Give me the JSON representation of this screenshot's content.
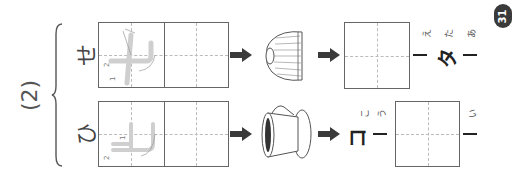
{
  "page": {
    "orientation": "rotated 90deg counter-clockwise",
    "page_number": "31"
  },
  "question": {
    "number": "(2)"
  },
  "rows": [
    {
      "kana": "せ",
      "trace_hint": "世",
      "stroke_labels": [
        "1",
        "2"
      ],
      "picture": "sweater",
      "answer_sequence": [
        {
          "type": "box",
          "furigana": ""
        },
        {
          "type": "mark",
          "text": "ー",
          "furigana": "え"
        },
        {
          "type": "kana",
          "text": "タ",
          "furigana": "た"
        },
        {
          "type": "mark",
          "text": "ー",
          "furigana": "あ"
        }
      ]
    },
    {
      "kana": "ひ",
      "trace_hint": "比",
      "stroke_labels": [
        "1",
        "2"
      ],
      "picture": "coffee-cup",
      "answer_sequence": [
        {
          "type": "kana",
          "text": "コ",
          "furigana": "こ"
        },
        {
          "type": "mark",
          "text": "ー",
          "furigana": "う"
        },
        {
          "type": "box",
          "furigana": ""
        },
        {
          "type": "mark",
          "text": "ー",
          "furigana": "い"
        }
      ]
    }
  ],
  "colors": {
    "line": "#666666",
    "dash": "#bbbbbb",
    "trace": "#cfcfcf",
    "arrow": "#3a3a3a",
    "badge": "#3a3a3a"
  }
}
